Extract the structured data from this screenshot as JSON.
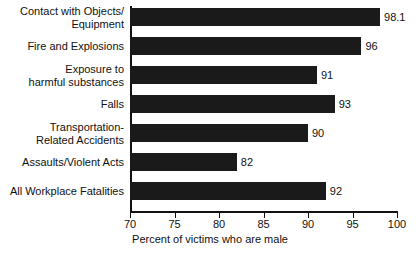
{
  "chart_data": {
    "type": "bar",
    "orientation": "horizontal",
    "title": "",
    "xlabel": "Percent of victims who are male",
    "ylabel": "",
    "xlim": [
      70,
      100
    ],
    "xticks": [
      70,
      75,
      80,
      85,
      90,
      95,
      100
    ],
    "grid": false,
    "legend": null,
    "bar_color": "#1a1a1a",
    "background": "#ffffff",
    "categories": [
      "Contact with Objects/\nEquipment",
      "Fire and Explosions",
      "Exposure to\nharmful substances",
      "Falls",
      "Transportation-\nRelated Accidents",
      "Assaults/Violent Acts",
      "All Workplace Fatalities"
    ],
    "values": [
      98.1,
      96,
      91,
      93,
      90,
      82,
      92
    ],
    "value_labels": [
      "98.1",
      "96",
      "91",
      "93",
      "90",
      "82",
      "92"
    ]
  }
}
